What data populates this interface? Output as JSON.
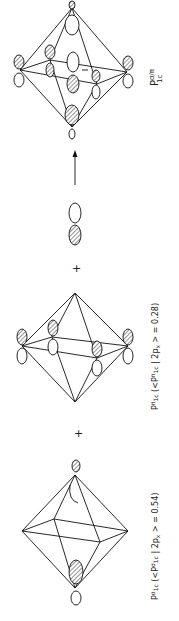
{
  "diagram": {
    "orientation": "rotated 90 degrees clockwise",
    "terms": [
      {
        "id": "sigma",
        "label_main": "P",
        "label_super": "σ",
        "label_sub": "1c",
        "label_rest": " (<P",
        "label_rest_super": "σ",
        "label_rest_sub": "1c",
        "label_tail": " | 2p",
        "label_tail_sub": "x",
        "label_value": " > = 0.54)"
      },
      {
        "id": "pi",
        "label_main": "P",
        "label_super": "π",
        "label_sub": "1c",
        "label_rest": " (<P",
        "label_rest_super": "π",
        "label_rest_sub": "1c",
        "label_tail": " | 2p",
        "label_tail_sub": "x",
        "label_value": " > = 0.28)"
      },
      {
        "id": "result",
        "label_main": "P",
        "label_super": "σ/π",
        "label_sub": "1c"
      }
    ],
    "operators": {
      "plus_1": "+",
      "plus_2": "+",
      "arrow": "→"
    }
  }
}
